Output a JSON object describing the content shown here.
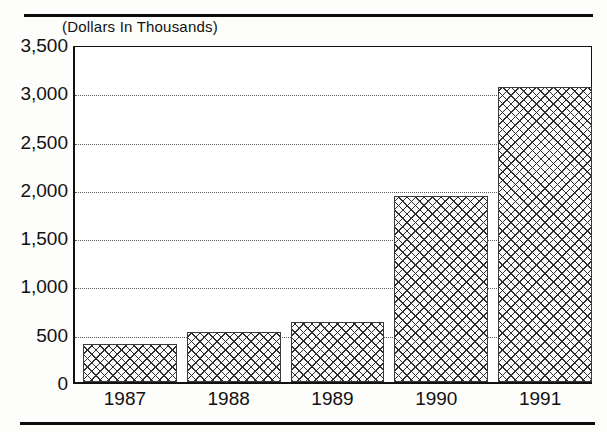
{
  "figure": {
    "caption": "(Dollars In Thousands)"
  },
  "chart_data": {
    "type": "bar",
    "title": "(Dollars In Thousands)",
    "xlabel": "",
    "ylabel": "(Dollars In Thousands)",
    "categories": [
      "1987",
      "1988",
      "1989",
      "1990",
      "1991"
    ],
    "values": [
      390,
      520,
      620,
      1930,
      3050
    ],
    "ylim": [
      0,
      3500
    ],
    "yticks": [
      0,
      500,
      1000,
      1500,
      2000,
      2500,
      3000,
      3500
    ],
    "ytick_labels": [
      "0",
      "500",
      "1,000",
      "1,500",
      "2,000",
      "2,500",
      "3,000",
      "3,500"
    ],
    "grid": true,
    "grid_style": "dotted-horizontal",
    "legend": "none",
    "bar_fill": "crosshatch",
    "colors": {
      "bar_edge": "#3a3a3a",
      "bar_fill": "#fbfbfb",
      "hatch": "#2e2e2e",
      "axis": "#111111",
      "grid": "#5a5a5a",
      "background": "#ffffff"
    }
  }
}
